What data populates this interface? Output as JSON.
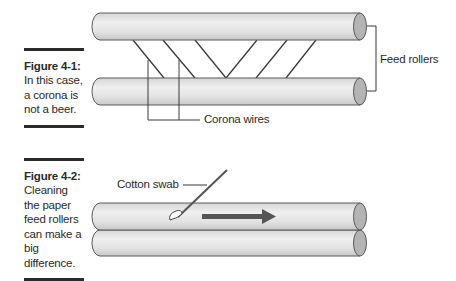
{
  "figures": [
    {
      "id": "figure-4-1",
      "title": "Figure 4-1:",
      "caption": "In this case, a corona is not a beer.",
      "labels": {
        "feed_rollers": "Feed rollers",
        "corona_wires": "Corona wires"
      }
    },
    {
      "id": "figure-4-2",
      "title": "Figure 4-2:",
      "caption": "Cleaning the paper feed rollers can make a big difference.",
      "labels": {
        "cotton_swab": "Cotton swab"
      }
    }
  ],
  "colors": {
    "roller_fill_light": "#eeeeee",
    "roller_fill_dark": "#cfcfcf",
    "roller_end": "#b4b4b4",
    "outline": "#5a5a5a",
    "arrow": "#555555",
    "caption_rule": "#2b2b2b"
  }
}
